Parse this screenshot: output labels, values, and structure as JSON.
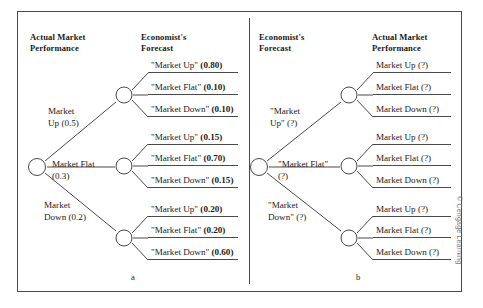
{
  "figure": {
    "panels": [
      {
        "letter": "a",
        "header_left": "Actual Market\nPerformance",
        "header_right": "Economist's\nForecast",
        "branches": [
          {
            "label": "Market\nUp (0.5)",
            "label_plain": "Market Up",
            "prob": "0.5",
            "leaves": [
              {
                "text": "\"Market Up\"",
                "prob": "(0.80)"
              },
              {
                "text": "\"Market Flat\"",
                "prob": "(0.10)"
              },
              {
                "text": "\"Market Down\"",
                "prob": "(0.10)"
              }
            ]
          },
          {
            "label": "Market Flat\n(0.3)",
            "label_plain": "Market Flat",
            "prob": "0.3",
            "leaves": [
              {
                "text": "\"Market Up\"",
                "prob": "(0.15)"
              },
              {
                "text": "\"Market Flat\"",
                "prob": "(0.70)"
              },
              {
                "text": "\"Market Down\"",
                "prob": "(0.15)"
              }
            ]
          },
          {
            "label": "Market\nDown (0.2)",
            "label_plain": "Market Down",
            "prob": "0.2",
            "leaves": [
              {
                "text": "\"Market Up\"",
                "prob": "(0.20)"
              },
              {
                "text": "\"Market Flat\"",
                "prob": "(0.20)"
              },
              {
                "text": "\"Market Down\"",
                "prob": "(0.60)"
              }
            ]
          }
        ]
      },
      {
        "letter": "b",
        "header_left": "Economist's\nForecast",
        "header_right": "Actual Market\nPerformance",
        "branches": [
          {
            "label": "\"Market\nUp\" (?)",
            "label_plain": "\"Market Up\"",
            "prob": "?",
            "leaves": [
              {
                "text": "Market Up",
                "prob": "(?)"
              },
              {
                "text": "Market Flat",
                "prob": "(?)"
              },
              {
                "text": "Market Down",
                "prob": "(?)"
              }
            ]
          },
          {
            "label": "\"Market Flat\"\n(?)",
            "label_plain": "\"Market Flat\"",
            "prob": "?",
            "leaves": [
              {
                "text": "Market Up",
                "prob": "(?)"
              },
              {
                "text": "Market Flat",
                "prob": "(?)"
              },
              {
                "text": "Market Down",
                "prob": "(?)"
              }
            ]
          },
          {
            "label": "\"Market\nDown\" (?)",
            "label_plain": "\"Market Down\"",
            "prob": "?",
            "leaves": [
              {
                "text": "Market Up",
                "prob": "(?)"
              },
              {
                "text": "Market Flat",
                "prob": "(?)"
              },
              {
                "text": "Market Down",
                "prob": "(?)"
              }
            ]
          }
        ]
      }
    ],
    "credit": "© Cengage Learning",
    "colors": {
      "line": "#4a4a4a",
      "text": "#1a1a1a",
      "credit": "#777777"
    }
  }
}
